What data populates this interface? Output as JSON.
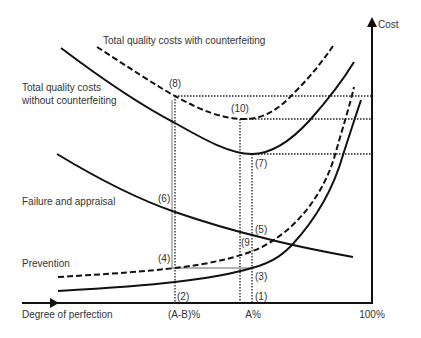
{
  "diagram": {
    "title_curves": {
      "total_with": "Total quality costs with counterfeiting",
      "total_without_line1": "Total quality costs",
      "total_without_line2": "without counterfeiting",
      "failure": "Failure and appraisal",
      "prevention": "Prevention"
    },
    "axes": {
      "y_label": "Cost",
      "x_label": "Degree of perfection",
      "x_ticks": [
        "(A-B)%",
        "A%",
        "100%"
      ]
    },
    "markers": {
      "m1": "(1)",
      "m2": "(2)",
      "m3": "(3)",
      "m4": "(4)",
      "m5": "(5)",
      "m6": "(6)",
      "m7": "(7)",
      "m8": "(8)",
      "m9": "(9",
      "m10": "(10)"
    },
    "colors": {
      "curve": "#111111",
      "guide": "#222222",
      "connector": "#9a9a9a",
      "text": "#333333"
    }
  }
}
